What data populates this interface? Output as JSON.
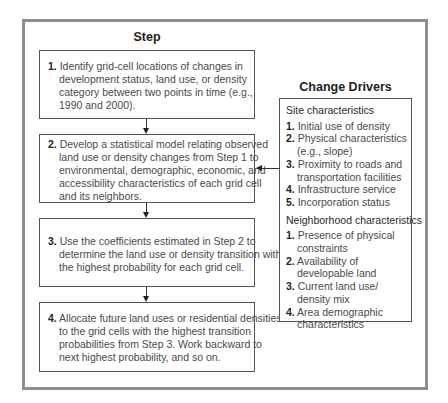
{
  "diagram": {
    "steps_heading": "Step",
    "drivers_heading": "Change Drivers",
    "steps": [
      {
        "number": "1.",
        "lines": [
          "Identify grid-cell locations of changes in",
          "development status, land use, or density",
          "category between two points in time (e.g.,",
          "1990 and 2000)."
        ]
      },
      {
        "number": "2.",
        "lines": [
          "Develop a statistical model relating observed",
          "land use or density changes from Step 1 to",
          "environmental, demographic, economic, and",
          "accessibility characteristics of each grid cell",
          "and its neighbors."
        ]
      },
      {
        "number": "3.",
        "lines": [
          "Use the coefficients estimated in Step 2 to",
          "determine the land use or density transition with",
          "the highest probability for each grid cell."
        ]
      },
      {
        "number": "4.",
        "lines": [
          "Allocate future land uses or residential densities",
          "to the grid cells with the highest transition",
          "probabilities from Step 3. Work backward to",
          "next highest probability, and so on."
        ]
      }
    ],
    "drivers": {
      "site": {
        "title": "Site characteristics",
        "items": [
          {
            "number": "1.",
            "lines": [
              "Initial use of density"
            ]
          },
          {
            "number": "2.",
            "lines": [
              "Physical characteristics",
              "(e.g., slope)"
            ]
          },
          {
            "number": "3.",
            "lines": [
              "Proximity to roads and",
              "transportation facilities"
            ]
          },
          {
            "number": "4.",
            "lines": [
              "Infrastructure service"
            ]
          },
          {
            "number": "5.",
            "lines": [
              "Incorporation status"
            ]
          }
        ]
      },
      "neighborhood": {
        "title": "Neighborhood characteristics",
        "items": [
          {
            "number": "1.",
            "lines": [
              "Presence of physical",
              "constraints"
            ]
          },
          {
            "number": "2.",
            "lines": [
              "Availability of",
              "developable land"
            ]
          },
          {
            "number": "3.",
            "lines": [
              "Current land use/",
              "density mix"
            ]
          },
          {
            "number": "4.",
            "lines": [
              "Area demographic",
              "characteristics"
            ]
          }
        ]
      }
    },
    "colors": {
      "frame": "#8e8e8e",
      "box_border": "#555555",
      "text": "#4a4a4a",
      "heading": "#1e1e1e"
    }
  }
}
